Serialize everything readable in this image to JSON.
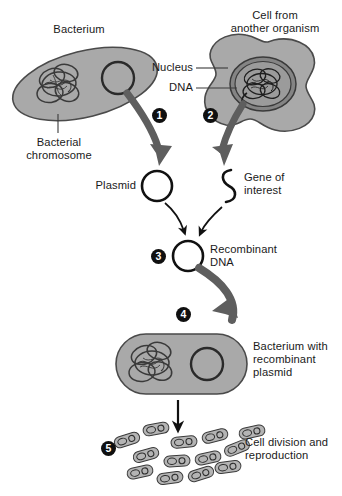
{
  "figure": {
    "width": 342,
    "height": 496,
    "background": "#ffffff"
  },
  "colors": {
    "cell_fill": "#a9a9a9",
    "cell_fill_light": "#b4b4b4",
    "cell_outline": "#4a4a4a",
    "nucleus_fill": "#808080",
    "nucleus_outline": "#3a3a3a",
    "thick_arrow": "#5e5e5e",
    "thin_arrow": "#111111",
    "badge_fill": "#101010",
    "badge_text": "#ffffff",
    "text": "#1a1a1a",
    "plasmid_stroke": "#111111",
    "leader_line": "#3a3a3a"
  },
  "labels": {
    "bacterium": "Bacterium",
    "cell_from_another_organism_line1": "Cell from",
    "cell_from_another_organism_line2": "another organism",
    "nucleus": "Nucleus",
    "dna": "DNA",
    "bacterial_chromosome_line1": "Bacterial",
    "bacterial_chromosome_line2": "chromosome",
    "plasmid": "Plasmid",
    "gene_of_interest_line1": "Gene of",
    "gene_of_interest_line2": "interest",
    "recombinant_dna_line1": "Recombinant",
    "recombinant_dna_line2": "DNA",
    "bacterium_with_recombinant_plasmid_line1": "Bacterium with",
    "bacterium_with_recombinant_plasmid_line2": "recombinant",
    "bacterium_with_recombinant_plasmid_line3": "plasmid",
    "cell_division_line1": "Cell division and",
    "cell_division_line2": "reproduction"
  },
  "steps": [
    {
      "number": "1",
      "description": "Plasmid is isolated from the bacterium"
    },
    {
      "number": "2",
      "description": "DNA is isolated from the nucleus of a cell from another organism"
    },
    {
      "number": "3",
      "description": "Gene of interest is inserted into the plasmid forming recombinant DNA"
    },
    {
      "number": "4",
      "description": "Recombinant plasmid is taken up by a bacterium"
    },
    {
      "number": "5",
      "description": "Bacterium with recombinant plasmid divides and reproduces"
    }
  ],
  "structures": {
    "bacterium_top": "tilted rod-shaped bacterial cell containing a tangled bacterial chromosome and a circular plasmid",
    "eukaryotic_cell": "irregular lobed cell containing a darker round nucleus with coiled DNA",
    "plasmid": "small circle outline",
    "gene_of_interest": "S-shaped squiggle of DNA",
    "recombinant_dna": "circle outline representing the recombinant plasmid",
    "bacterium_bottom": "horizontal rod-shaped bacterium containing chromosome and recombinant plasmid",
    "clone_colony_count": 13
  }
}
